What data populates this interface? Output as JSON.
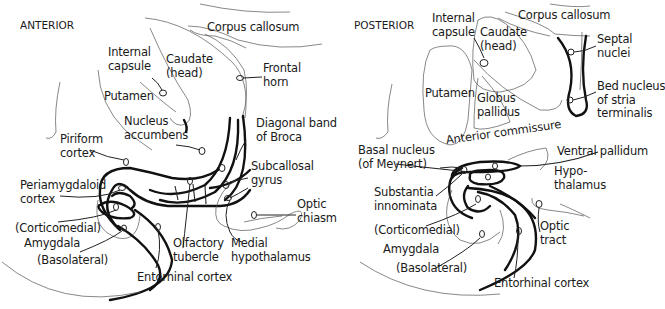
{
  "figure": {
    "panels": [
      {
        "id": "anterior",
        "title": "ANTERIOR",
        "labels": {
          "corpus_callosum": "Corpus callosum",
          "internal_capsule": "Internal\ncapsule",
          "caudate_head": "Caudate\n(head)",
          "frontal_horn": "Frontal\nhorn",
          "putamen": "Putamen",
          "nucleus_accumbens": "Nucleus\naccumbens",
          "diagonal_band": "Diagonal band\nof Broca",
          "piriform_cortex": "Piriform\ncortex",
          "subcallosal_gyrus": "Subcallosal\ngyrus",
          "periamygdaloid_cortex": "Periamygdaloid\ncortex",
          "optic_chiasm": "Optic\nchiasm",
          "corticomedial": "(Corticomedial)",
          "amygdala": "Amygdala",
          "basolateral": "(Basolateral)",
          "olfactory_tubercle": "Olfactory\ntubercle",
          "medial_hypothalamus": "Medial\nhypothalamus",
          "entorhinal_cortex": "Entorhinal cortex"
        }
      },
      {
        "id": "posterior",
        "title": "POSTERIOR",
        "labels": {
          "internal_capsule": "Internal\ncapsule",
          "corpus_callosum": "Corpus callosum",
          "caudate_head": "Caudate\n(head)",
          "septal_nuclei": "Septal\nnuclei",
          "putamen": "Putamen",
          "globus_pallidus": "Globus\npallidus",
          "bed_nucleus": "Bed nucleus\nof stria\nterminalis",
          "anterior_commissure": "Anterior commissure",
          "basal_nucleus": "Basal nucleus\n(of Meynert)",
          "ventral_pallidum": "Ventral pallidum",
          "hypothalamus": "Hypo-\nthalamus",
          "substantia_innominata": "Substantia\ninnominata",
          "corticomedial": "(Corticomedial)",
          "optic_tract": "Optic\ntract",
          "amygdala": "Amygdala",
          "basolateral": "(Basolateral)",
          "entorhinal_cortex": "Entorhinal cortex"
        }
      }
    ]
  }
}
